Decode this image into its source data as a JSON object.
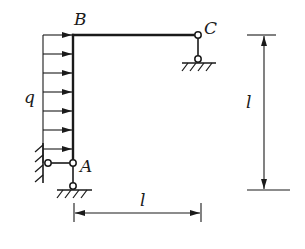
{
  "figure": {
    "type": "structural frame diagram",
    "labels": {
      "B": "B",
      "C": "C",
      "A": "A",
      "load": "q",
      "dim_vertical": "l",
      "dim_horizontal": "l"
    },
    "colors": {
      "line": "#1a1a1a",
      "background": "#ffffff"
    },
    "members": [
      {
        "name": "column-AB",
        "from": "A",
        "to": "B"
      },
      {
        "name": "beam-BC",
        "from": "B",
        "to": "C"
      }
    ],
    "supports": [
      {
        "at": "C",
        "kind": "pinned link to ground"
      },
      {
        "at": "A",
        "kind": "horizontal link to wall"
      },
      {
        "at": "A",
        "kind": "vertical link to ground"
      }
    ],
    "load": {
      "kind": "uniformly distributed horizontal",
      "symbol": "q",
      "arrow_count": 7
    },
    "dimensions": [
      {
        "orientation": "vertical",
        "label": "l"
      },
      {
        "orientation": "horizontal",
        "label": "l"
      }
    ]
  }
}
